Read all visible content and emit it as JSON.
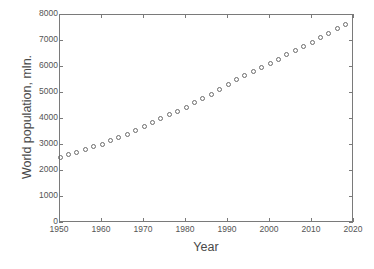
{
  "chart_data": {
    "type": "scatter",
    "title": "",
    "subtitle": "",
    "xlabel": "Year",
    "ylabel": "World population, mln.",
    "xlim": [
      1950,
      2020
    ],
    "ylim": [
      0,
      8000
    ],
    "xticks": [
      1950,
      1960,
      1970,
      1980,
      1990,
      2000,
      2010,
      2020
    ],
    "xtick_labels": [
      "1950",
      "1960",
      "1970",
      "1980",
      "1990",
      "2000",
      "2010",
      "2020"
    ],
    "yticks": [
      0,
      1000,
      2000,
      3000,
      4000,
      5000,
      6000,
      7000,
      8000
    ],
    "ytick_labels": [
      "0",
      "1000",
      "2000",
      "3000",
      "4000",
      "5000",
      "6000",
      "7000",
      "8000"
    ],
    "grid": false,
    "legend": null,
    "marker": "open-circle",
    "marker_color": "#6b6b6b",
    "axis_color": "#7a7a7a",
    "background_color": "#ffffff",
    "x": [
      1950,
      1952,
      1954,
      1956,
      1958,
      1960,
      1962,
      1964,
      1966,
      1968,
      1970,
      1972,
      1974,
      1976,
      1978,
      1980,
      1982,
      1984,
      1986,
      1988,
      1990,
      1992,
      1994,
      1996,
      1998,
      2000,
      2002,
      2004,
      2006,
      2008,
      2010,
      2012,
      2014,
      2016,
      2018
    ],
    "values": [
      2536,
      2630,
      2727,
      2828,
      2940,
      3035,
      3155,
      3270,
      3410,
      3555,
      3700,
      3860,
      4016,
      4160,
      4300,
      4458,
      4621,
      4789,
      4961,
      5138,
      5327,
      5506,
      5674,
      5835,
      5991,
      6144,
      6301,
      6462,
      6622,
      6785,
      6957,
      7126,
      7295,
      7464,
      7632
    ]
  },
  "figure": {
    "caption": ""
  }
}
